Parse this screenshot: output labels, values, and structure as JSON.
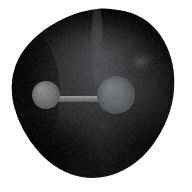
{
  "image": {
    "width": 192,
    "height": 192,
    "background_color": "#ffffff",
    "title": "Molecular ball-and-stick model inside dark isosurface volume",
    "render_style": "dark shaded volumetric blob with embedded ball-and-stick molecule",
    "grain": {
      "enabled": true,
      "amount": 14
    }
  },
  "blob": {
    "name": "isosurface-volume",
    "description": "large dark rounded teardrop-shaped surface",
    "center_x": 94,
    "center_y": 93,
    "radius_x": 84,
    "radius_y": 86,
    "bounds": {
      "left": 10,
      "top": 8,
      "right": 176,
      "bottom": 179
    },
    "fill_dark": "#0b0b0c",
    "fill_mid": "#3a3b3d",
    "fill_light": "#57595c",
    "edge_color": "#050506",
    "shading_light_x": 103,
    "shading_light_y": 58,
    "outline_points": [
      [
        110,
        8
      ],
      [
        138,
        14
      ],
      [
        158,
        30
      ],
      [
        170,
        52
      ],
      [
        175,
        76
      ],
      [
        173,
        104
      ],
      [
        162,
        132
      ],
      [
        143,
        158
      ],
      [
        118,
        174
      ],
      [
        94,
        179
      ],
      [
        70,
        175
      ],
      [
        48,
        162
      ],
      [
        30,
        142
      ],
      [
        17,
        118
      ],
      [
        11,
        94
      ],
      [
        13,
        70
      ],
      [
        24,
        48
      ],
      [
        44,
        29
      ],
      [
        70,
        15
      ],
      [
        92,
        9
      ]
    ]
  },
  "atoms": [
    {
      "label": "atom-small-left",
      "center_x": 46,
      "center_y": 95,
      "radius": 14,
      "fill_light": "#8d8f90",
      "fill_mid": "#76787a",
      "fill_dark": "#565859",
      "highlight_x": 41,
      "highlight_y": 88
    },
    {
      "label": "atom-large-center",
      "center_x": 116,
      "center_y": 95,
      "radius": 19,
      "fill_light": "#7b7d7f",
      "fill_mid": "#676a6c",
      "fill_dark": "#4c4e50",
      "highlight_x": 110,
      "highlight_y": 87
    }
  ],
  "bond": {
    "label": "bond-cylinder",
    "x1": 57,
    "y1": 99,
    "x2": 101,
    "y2": 99,
    "thickness": 6,
    "fill_top": "#9a9c9d",
    "fill_mid": "#808284",
    "fill_bottom": "#58595b"
  },
  "highlights": [
    {
      "label": "specular-highlight-upper-right",
      "center_x": 140,
      "center_y": 62,
      "radius_x": 20,
      "radius_y": 17,
      "color": "#74767a",
      "opacity": 0.55
    },
    {
      "label": "light-streak-upper-center",
      "center_x": 97,
      "center_y": 44,
      "radius_x": 6,
      "radius_y": 42,
      "color": "#6a6c70",
      "opacity": 0.38
    },
    {
      "label": "soft-glow-center",
      "center_x": 104,
      "center_y": 78,
      "radius_x": 52,
      "radius_y": 50,
      "color": "#4e5053",
      "opacity": 0.5
    }
  ],
  "shadows": [
    {
      "label": "shadow-bottom-left",
      "center_x": 52,
      "center_y": 152,
      "radius_x": 58,
      "radius_y": 46,
      "color": "#000000",
      "opacity": 0.72
    },
    {
      "label": "shadow-bottom-right",
      "center_x": 146,
      "center_y": 146,
      "radius_x": 48,
      "radius_y": 48,
      "color": "#000000",
      "opacity": 0.55
    },
    {
      "label": "shadow-left-rim",
      "center_x": 26,
      "center_y": 92,
      "radius_x": 34,
      "radius_y": 62,
      "color": "#000000",
      "opacity": 0.62
    }
  ]
}
